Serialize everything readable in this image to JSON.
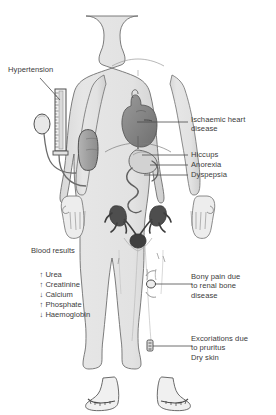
{
  "figure": {
    "type": "annotated-medical-diagram",
    "body_outline_fill": "#e3e3e3",
    "organ_fill_dark": "#8a8a8a",
    "stroke_color": "#555555",
    "text_color": "#3b3b3b"
  },
  "labels": {
    "hypertension": "Hypertension",
    "ischaemic_heart_disease": "Ischaemic heart\ndisease",
    "hiccups": "Hiccups",
    "anorexia": "Anorexia",
    "dyspepsia": "Dyspepsia",
    "bony_pain": "Bony pain due\nto renal bone\ndisease",
    "excoriations": "Excoriations due\nto pruritus\nDry skin"
  },
  "blood_results": {
    "title": "Blood results",
    "rows": [
      {
        "arrow": "↑",
        "analyte": "Urea",
        "direction": "raised"
      },
      {
        "arrow": "↑",
        "analyte": "Creatinine",
        "direction": "raised"
      },
      {
        "arrow": "↓",
        "analyte": "Calcium",
        "direction": "lowered"
      },
      {
        "arrow": "↑",
        "analyte": "Phosphate",
        "direction": "raised"
      },
      {
        "arrow": "↓",
        "analyte": "Haemoglobin",
        "direction": "lowered"
      }
    ]
  },
  "instrument": {
    "name": "sphygmomanometer",
    "parts": [
      "mercury-column",
      "inflation-bulb",
      "arm-cuff",
      "tubing"
    ]
  },
  "anatomy": {
    "organs": [
      "heart",
      "stomach",
      "small-intestine",
      "kidneys",
      "ureters",
      "bladder"
    ],
    "markers": [
      "knee-bone-lesion",
      "shin-excoriation"
    ]
  }
}
